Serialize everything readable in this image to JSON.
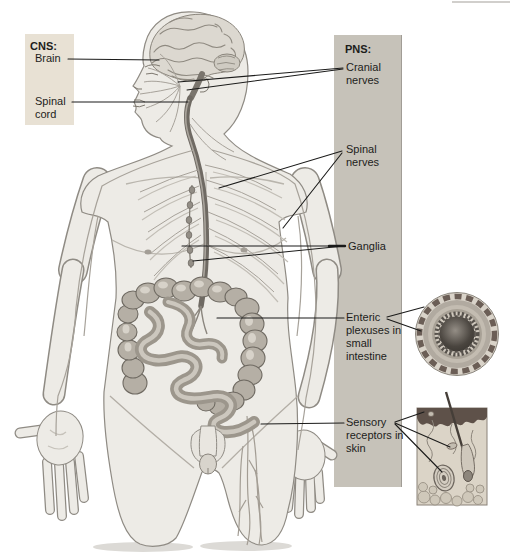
{
  "labels": {
    "cns_heading": "CNS:",
    "brain": "Brain",
    "spinal_cord": "Spinal cord",
    "pns_heading": "PNS:",
    "cranial_nerves": "Cranial nerves",
    "spinal_nerves": "Spinal nerves",
    "ganglia": "Ganglia",
    "enteric_plexuses": "Enteric plexuses in small intestine",
    "sensory_receptors": "Sensory receptors in skin"
  },
  "art": {
    "body_illustration": "human-figure-with-nervous-system",
    "intestine_inset": "small-intestine-cross-section",
    "skin_inset": "skin-cross-section"
  },
  "colors": {
    "cns_box_bg": "#e8e1d4",
    "pns_bar_bg": "#c6c2b9",
    "leader_line": "#1b1b1a",
    "skin": "#edebe6",
    "outline": "#8f8b84",
    "text": "#1d1d1b"
  }
}
